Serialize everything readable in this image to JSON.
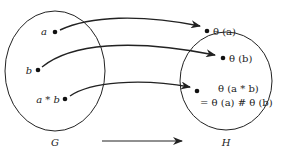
{
  "diagram": {
    "sets": {
      "domain": {
        "label": "G"
      },
      "codomain": {
        "label": "H"
      }
    },
    "domain_elements": [
      {
        "label": "a"
      },
      {
        "label": "b"
      },
      {
        "label": "a * b"
      }
    ],
    "codomain_elements": [
      {
        "label": "θ (a)"
      },
      {
        "label": "θ (b)"
      },
      {
        "label": "θ (a * b)",
        "label_line2": "= θ (a) # θ (b)"
      }
    ],
    "mapping_arrow": {
      "direction": "G to H"
    }
  }
}
